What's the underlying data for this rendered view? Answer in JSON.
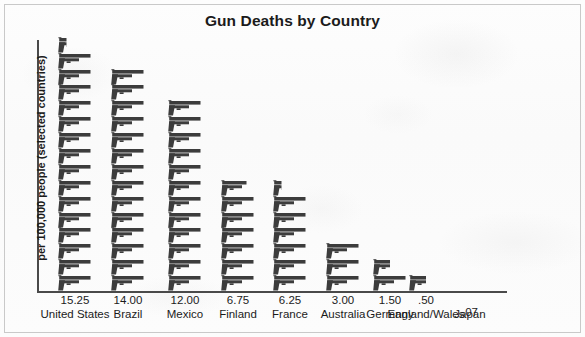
{
  "page": {
    "title": "Gun Deaths by Country"
  },
  "chart_data": {
    "type": "bar",
    "title": "Gun Deaths by Country",
    "subtitle": "",
    "xlabel": "",
    "ylabel": "per 100,000 people (selected countries)",
    "pictograph": {
      "icon": "pistol-icon",
      "unit_value": 1,
      "description": "each pistol icon represents 1 death per 100,000 people"
    },
    "grid": false,
    "legend": null,
    "ylim": [
      0,
      16
    ],
    "categories": [
      "United States",
      "Brazil",
      "Mexico",
      "Finland",
      "France",
      "Australia",
      "Germany",
      "England/Wales",
      "Japan"
    ],
    "values": [
      15.25,
      14.0,
      12.0,
      6.75,
      6.25,
      3.0,
      1.5,
      0.5,
      0.07
    ],
    "value_labels": [
      "15.25",
      "14.00",
      "12.00",
      "6.75",
      "6.25",
      "3.00",
      "1.50",
      ".50",
      ".07"
    ],
    "icon_counts": [
      15.25,
      14,
      12,
      6.75,
      6.25,
      3,
      1.5,
      0.5,
      0
    ]
  },
  "colors": {
    "icon": "#3c3c3c",
    "axis": "#4a4a4a",
    "text": "#1b1b1b",
    "background": "#fbfbfb",
    "border": "#c9c9c9"
  }
}
